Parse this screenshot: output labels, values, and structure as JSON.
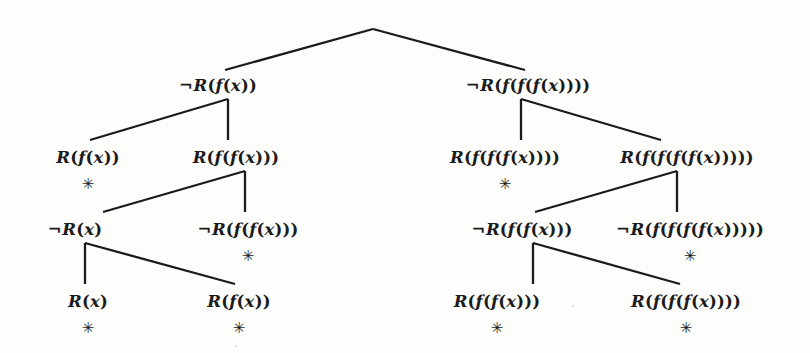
{
  "figure": {
    "kind": "refutation-tree",
    "background_color": "#fdfdfc",
    "ink_color": "#1b1b1b",
    "closed_branch_marker": "✳",
    "width": 810,
    "height": 353
  },
  "levels": {
    "level1_y": 85,
    "level2_y": 157,
    "level3_y": 229,
    "level4_y": 301,
    "marker_offset_y": 27
  },
  "nodes": [
    {
      "id": "root",
      "label": "",
      "x": 373,
      "y": 29,
      "is_apex": true,
      "closed": false
    },
    {
      "id": "L1",
      "label": "¬R(f(x))",
      "x": 218,
      "y": 85,
      "is_apex": false,
      "closed": false
    },
    {
      "id": "R1",
      "label": "¬R(f(f(f(x))))",
      "x": 528,
      "y": 85,
      "is_apex": false,
      "closed": false
    },
    {
      "id": "L2a",
      "label": "R(f(x))",
      "x": 88,
      "y": 157,
      "is_apex": false,
      "closed": true
    },
    {
      "id": "L2b",
      "label": "R(f(f(x)))",
      "x": 236,
      "y": 157,
      "is_apex": false,
      "closed": false
    },
    {
      "id": "R2a",
      "label": "R(f(f(f(x))))",
      "x": 505,
      "y": 157,
      "is_apex": false,
      "closed": true
    },
    {
      "id": "R2b",
      "label": "R(f(f(f(f(x)))))",
      "x": 687,
      "y": 157,
      "is_apex": false,
      "closed": false
    },
    {
      "id": "L3a",
      "label": "¬R(x)",
      "x": 75,
      "y": 229,
      "is_apex": false,
      "closed": false
    },
    {
      "id": "L3b",
      "label": "¬R(f(f(x)))",
      "x": 248,
      "y": 229,
      "is_apex": false,
      "closed": true
    },
    {
      "id": "R3a",
      "label": "¬R(f(f(x)))",
      "x": 522,
      "y": 229,
      "is_apex": false,
      "closed": false
    },
    {
      "id": "R3b",
      "label": "¬R(f(f(f(f(x)))))",
      "x": 690,
      "y": 229,
      "is_apex": false,
      "closed": true
    },
    {
      "id": "L4a",
      "label": "R(x)",
      "x": 88,
      "y": 301,
      "is_apex": false,
      "closed": true
    },
    {
      "id": "L4b",
      "label": "R(f(x))",
      "x": 239,
      "y": 301,
      "is_apex": false,
      "closed": true
    },
    {
      "id": "R4a",
      "label": "R(f(f(x)))",
      "x": 497,
      "y": 301,
      "is_apex": false,
      "closed": true
    },
    {
      "id": "R4b",
      "label": "R(f(f(f(x))))",
      "x": 686,
      "y": 301,
      "is_apex": false,
      "closed": true
    }
  ],
  "edges": [
    {
      "id": "apex-left",
      "points": "373,29 225,70"
    },
    {
      "id": "apex-right",
      "points": "373,29 525,70"
    },
    {
      "id": "L1-stub",
      "points": "228,99 228,140"
    },
    {
      "id": "L1-left",
      "points": "228,99 90,140"
    },
    {
      "id": "L2b-stub",
      "points": "245,171 245,212"
    },
    {
      "id": "L2b-left",
      "points": "245,171 103,212"
    },
    {
      "id": "L3a-stub",
      "points": "85,243 85,284"
    },
    {
      "id": "L3a-right",
      "points": "85,243 235,284"
    },
    {
      "id": "R1-stub",
      "points": "521,99 521,140"
    },
    {
      "id": "R1-right",
      "points": "521,99 661,140"
    },
    {
      "id": "R2b-stub",
      "points": "677,171 677,212"
    },
    {
      "id": "R2b-left",
      "points": "677,171 535,212"
    },
    {
      "id": "R3a-stub",
      "points": "533,243 533,284"
    },
    {
      "id": "R3a-right",
      "points": "533,243 680,284"
    }
  ],
  "specks": [
    {
      "x": 235,
      "y": 345
    },
    {
      "x": 572,
      "y": 305
    }
  ]
}
